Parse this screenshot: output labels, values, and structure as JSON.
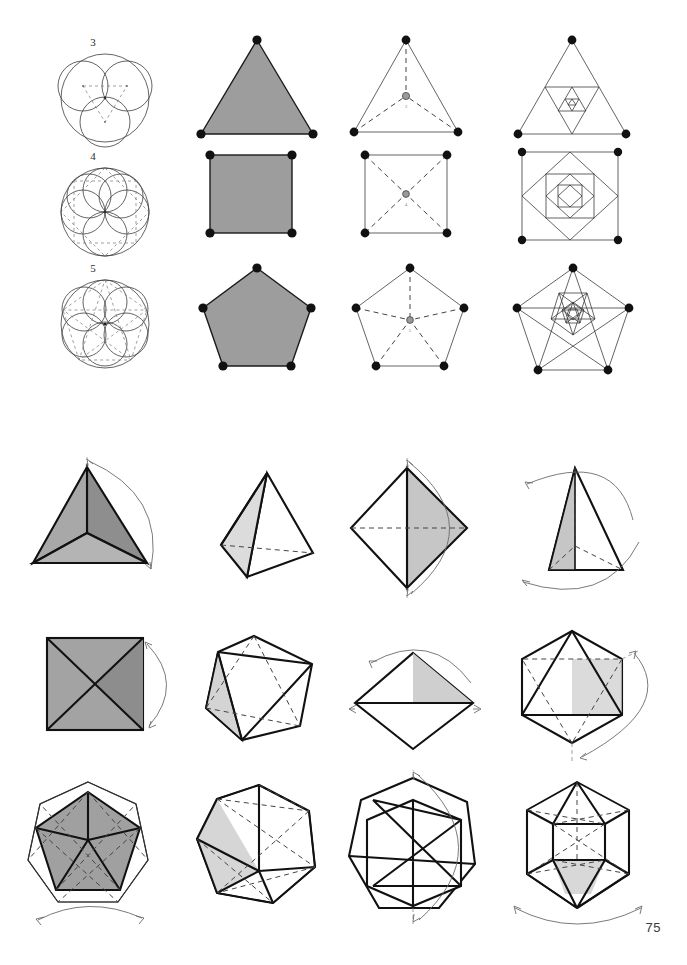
{
  "page": {
    "number": "75",
    "width": 687,
    "height": 965,
    "background": "#ffffff",
    "ink": "#1a1a1a"
  },
  "palette": {
    "ink": "#1a1a1a",
    "line_thin": "#3c3c3c",
    "line_heavy": "#111111",
    "dashed": "#444444",
    "arrow": "#6b6b6b",
    "fill_mid_gray": "#9d9d9d",
    "fill_light_gray": "#c9c9c9",
    "fill_stipple": "#b5b5b5",
    "vertex_dot": "#111111",
    "center_dot": "#9a9a9a"
  },
  "upper_grid": {
    "description": "Polygon construction series: rosette of circles, filled polygon, radial dashed subdivision, nested involution",
    "row_labels": [
      "3",
      "4",
      "5"
    ],
    "rows": [
      {
        "label": "3",
        "sides": 3,
        "cells": [
          {
            "kind": "circle-rosette",
            "name": "triangle-rosette",
            "circle_count": 3
          },
          {
            "kind": "filled-polygon",
            "name": "filled-triangle",
            "fill": "#9d9d9d",
            "vertices": 3
          },
          {
            "kind": "radial-center",
            "name": "triangle-radial",
            "vertices": 3,
            "center_label": "3"
          },
          {
            "kind": "nested-involution",
            "name": "triangle-nested",
            "vertices": 3,
            "levels": 4
          }
        ]
      },
      {
        "label": "4",
        "sides": 4,
        "cells": [
          {
            "kind": "circle-rosette",
            "name": "square-rosette",
            "circle_count": 4
          },
          {
            "kind": "filled-polygon",
            "name": "filled-square",
            "fill": "#9d9d9d",
            "vertices": 4
          },
          {
            "kind": "radial-center",
            "name": "square-radial",
            "vertices": 4,
            "center_label": "4"
          },
          {
            "kind": "nested-involution",
            "name": "square-nested",
            "vertices": 4,
            "levels": 4
          }
        ]
      },
      {
        "label": "5",
        "sides": 5,
        "cells": [
          {
            "kind": "circle-rosette",
            "name": "pentagon-rosette",
            "circle_count": 6
          },
          {
            "kind": "filled-polygon",
            "name": "filled-pentagon",
            "fill": "#9d9d9d",
            "vertices": 5
          },
          {
            "kind": "radial-center",
            "name": "pentagon-radial",
            "vertices": 5,
            "center_label": "5"
          },
          {
            "kind": "nested-involution",
            "name": "pentagon-nested",
            "vertices": 5,
            "levels": 4
          }
        ]
      }
    ]
  },
  "lower_grid": {
    "description": "Platonic solids in four projections each, with curved rotation arrows indicating axis of symmetry",
    "rows": [
      {
        "solid": "tetrahedron",
        "cells": [
          {
            "name": "tetrahedron-plan-view",
            "view": "plan",
            "shaded": true,
            "arrow": "right-arc-double"
          },
          {
            "name": "tetrahedron-perspective",
            "view": "perspective",
            "shaded": true,
            "arrow": "none"
          },
          {
            "name": "tetrahedron-edge-view",
            "view": "edge-on",
            "shaded": true,
            "arrow": "right-arc-double"
          },
          {
            "name": "tetrahedron-face-view",
            "view": "face-on",
            "shaded": true,
            "arrow": "left-arc-double"
          }
        ]
      },
      {
        "solid": "octahedron",
        "cells": [
          {
            "name": "octahedron-plan-view",
            "view": "plan",
            "shaded": true,
            "arrow": "right-arc-double"
          },
          {
            "name": "octahedron-perspective",
            "view": "perspective",
            "shaded": true,
            "arrow": "none"
          },
          {
            "name": "octahedron-edge-view",
            "view": "edge-on",
            "shaded": true,
            "arrow": "left-arc-double"
          },
          {
            "name": "octahedron-vertex-view",
            "view": "vertex-on",
            "shaded": true,
            "arrow": "right-arc-double"
          }
        ]
      },
      {
        "solid": "icosahedron",
        "cells": [
          {
            "name": "icosahedron-plan-view",
            "view": "plan",
            "shaded": true,
            "arrow": "bottom-arc-double"
          },
          {
            "name": "icosahedron-perspective",
            "view": "perspective",
            "shaded": true,
            "arrow": "none"
          },
          {
            "name": "icosahedron-edge-view",
            "view": "edge-on",
            "shaded": true,
            "arrow": "right-arc-double"
          },
          {
            "name": "icosahedron-vertex-view",
            "view": "vertex-on",
            "shaded": true,
            "arrow": "bottom-arc-double"
          }
        ]
      }
    ]
  }
}
